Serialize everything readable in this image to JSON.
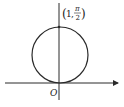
{
  "diagram": {
    "type": "polar-circle",
    "point_label": {
      "open": "(",
      "r": "1",
      "sep": ",",
      "theta_num": "π",
      "theta_den": "2",
      "close": ")"
    },
    "origin_label": "O",
    "colors": {
      "stroke": "#2a2a2a",
      "background": "#ffffff"
    }
  }
}
